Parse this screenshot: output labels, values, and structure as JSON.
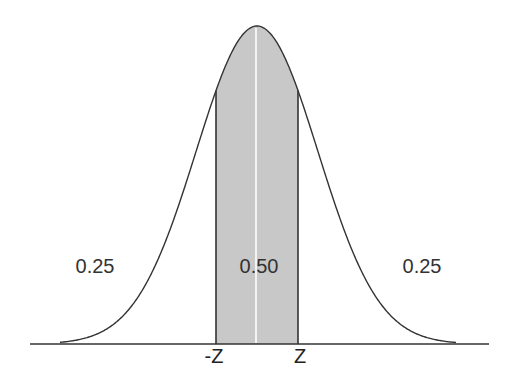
{
  "diagram": {
    "title": "",
    "distribution": "standard normal",
    "z_value": 0.674,
    "areas": {
      "left_tail": "0.25",
      "center": "0.50",
      "right_tail": "0.25"
    },
    "tick_labels": {
      "neg_z": "-Z",
      "pos_z": "Z"
    },
    "colors": {
      "shade": "#c8c8c8",
      "curve": "#333333",
      "axis": "#333333",
      "center_line": "#ffffff"
    }
  }
}
